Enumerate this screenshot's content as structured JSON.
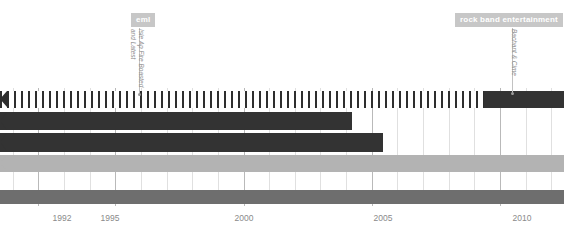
{
  "chart_data": {
    "type": "bar",
    "title": "",
    "xlabel": "",
    "ylabel": "",
    "orientation": "horizontal",
    "axis": {
      "xlim": [
        1990.5,
        2012.5
      ],
      "grid": true,
      "tick_labels": [
        "1992",
        "1995",
        "2000",
        "2005",
        "2010"
      ],
      "tick_values": [
        1992,
        1995,
        2000,
        2005,
        2010
      ],
      "minor_tick_interval": 1
    },
    "categories": [
      "ruler-band",
      "row-2",
      "row-3",
      "row-4",
      "row-5"
    ],
    "series": [
      {
        "name": "ruler-band",
        "segments": [
          {
            "start": 1990.5,
            "end": 2007.8,
            "style": "striped",
            "color": "#2e2e2e"
          },
          {
            "start": 2007.8,
            "end": 2011.0,
            "style": "solid",
            "color": "#333333"
          }
        ]
      },
      {
        "name": "row-2",
        "segments": [
          {
            "start": 1990.5,
            "end": 2003.9,
            "style": "solid",
            "color": "#333333"
          }
        ]
      },
      {
        "name": "row-3",
        "segments": [
          {
            "start": 1990.5,
            "end": 2005.0,
            "style": "solid",
            "color": "#333333"
          }
        ]
      },
      {
        "name": "row-4",
        "segments": [
          {
            "start": 1990.5,
            "end": 2011.0,
            "style": "solid",
            "color": "#b3b3b3"
          }
        ]
      },
      {
        "name": "row-5",
        "segments": [
          {
            "start": 1990.5,
            "end": 2011.0,
            "style": "solid",
            "color": "#6e6e6e"
          }
        ]
      }
    ],
    "annotations": [
      {
        "badge": "eml",
        "sub_label_line1": "Isle Ap Fire Boasted",
        "sub_label_line2": "and Latest",
        "x_value": 1995.3
      },
      {
        "badge": "rock band entertainment",
        "sub_label_line1": "Bachant & Cime",
        "sub_label_line2": "",
        "x_value": 2009.2
      }
    ],
    "colors": {
      "dark": "#333333",
      "mid": "#6e6e6e",
      "light": "#b3b3b3",
      "badge": "#c7c7c7",
      "gridline": "#b9b9b9",
      "gridline_minor": "#e0e0e0",
      "axis_text": "#8a8a8a"
    }
  },
  "axis": {
    "labels": [
      {
        "text": "1992",
        "x": 62
      },
      {
        "text": "1995",
        "x": 110
      },
      {
        "text": "2000",
        "x": 244
      },
      {
        "text": "2005",
        "x": 383
      },
      {
        "text": "2010",
        "x": 522
      }
    ]
  },
  "annotations": {
    "left": {
      "badge": "eml",
      "sub_line1": "Isle Ap Fire Boasted",
      "sub_line2": "and Latest"
    },
    "right": {
      "badge": "rock band entertainment",
      "sub_line1": "Bachant & Cime",
      "sub_line2": ""
    }
  }
}
